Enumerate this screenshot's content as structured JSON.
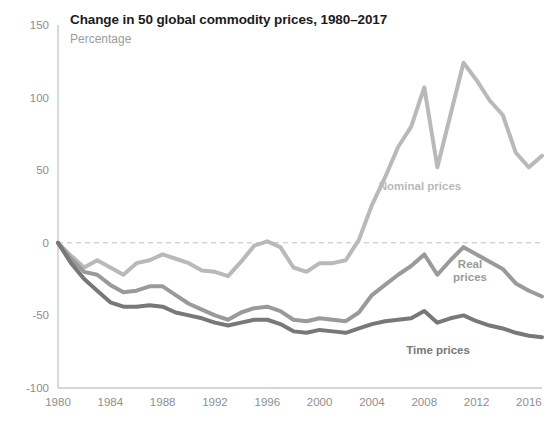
{
  "header": {
    "title": "Change in 50 global commodity prices, 1980–2017",
    "subtitle": "Percentage"
  },
  "colors": {
    "nominal": "#b9b9b9",
    "real": "#9a9a9a",
    "time": "#787878",
    "axis": "#c9c9c9",
    "tick_text": "#8e8e8e",
    "title_text": "#1c1c1c",
    "subtitle_text": "#9b9b9b",
    "zero_line": "#c0c0c0",
    "background": "#ffffff"
  },
  "labels": {
    "nominal": "Nominal prices",
    "real_line1": "Real",
    "real_line2": "prices",
    "time": "Time prices"
  },
  "chart_data": {
    "type": "line",
    "title": "Change in 50 global commodity prices, 1980–2017",
    "subtitle": "Percentage",
    "xlabel": "",
    "ylabel": "Percentage",
    "ylim": [
      -100,
      150
    ],
    "xlim": [
      1980,
      2017
    ],
    "yticks": [
      150,
      100,
      50,
      0,
      -50,
      -100
    ],
    "xticks": [
      1980,
      1984,
      1988,
      1992,
      1996,
      2000,
      2004,
      2008,
      2012,
      2016
    ],
    "grid": false,
    "zero_reference_line": 0,
    "legend": "inline-labels",
    "x": [
      1980,
      1981,
      1982,
      1983,
      1984,
      1985,
      1986,
      1987,
      1988,
      1989,
      1990,
      1991,
      1992,
      1993,
      1994,
      1995,
      1996,
      1997,
      1998,
      1999,
      2000,
      2001,
      2002,
      2003,
      2004,
      2005,
      2006,
      2007,
      2008,
      2009,
      2010,
      2011,
      2012,
      2013,
      2014,
      2015,
      2016,
      2017
    ],
    "series": [
      {
        "name": "Nominal prices",
        "color": "#b9b9b9",
        "values": [
          0,
          -9,
          -17,
          -12,
          -17,
          -22,
          -14,
          -12,
          -8,
          -11,
          -14,
          -19,
          -20,
          -23,
          -13,
          -2,
          1,
          -3,
          -17,
          -20,
          -14,
          -14,
          -12,
          2,
          26,
          45,
          66,
          80,
          107,
          52,
          88,
          124,
          112,
          98,
          88,
          62,
          52,
          60
        ]
      },
      {
        "name": "Real prices",
        "color": "#9a9a9a",
        "values": [
          0,
          -11,
          -20,
          -22,
          -29,
          -34,
          -33,
          -30,
          -30,
          -36,
          -42,
          -46,
          -50,
          -53,
          -48,
          -45,
          -44,
          -47,
          -53,
          -54,
          -52,
          -53,
          -54,
          -48,
          -36,
          -29,
          -22,
          -16,
          -8,
          -22,
          -12,
          -3,
          -8,
          -13,
          -18,
          -28,
          -33,
          -37
        ]
      },
      {
        "name": "Time prices",
        "color": "#787878",
        "values": [
          0,
          -14,
          -25,
          -33,
          -41,
          -44,
          -44,
          -43,
          -44,
          -48,
          -50,
          -52,
          -55,
          -57,
          -55,
          -53,
          -53,
          -56,
          -61,
          -62,
          -60,
          -61,
          -62,
          -59,
          -56,
          -54,
          -53,
          -52,
          -47,
          -55,
          -52,
          -50,
          -54,
          -57,
          -59,
          -62,
          -64,
          -65
        ]
      }
    ]
  },
  "series_label_positions": {
    "nominal": {
      "x": 420,
      "y": 190
    },
    "real": {
      "x": 470,
      "y": 268
    },
    "time": {
      "x": 438,
      "y": 354
    }
  }
}
